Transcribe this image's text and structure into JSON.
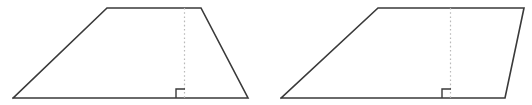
{
  "canvas": {
    "width": 532,
    "height": 105,
    "background": "#ffffff",
    "stroke_color": "#3a3a3a",
    "altitude_color": "#b9b9b9"
  },
  "figures": [
    {
      "name": "trapezoid",
      "label": "Isosceles trapezoid with altitude",
      "outline_points": "13,98 107,8 201,8 248,98 13,98",
      "altitude_line": {
        "x1": 184.5,
        "y1": 8,
        "x2": 184.5,
        "y2": 98
      },
      "right_angle_marker": "176,98 176,89 185,89",
      "vertices": [
        {
          "name": "bottom-left",
          "x": 13,
          "y": 98
        },
        {
          "name": "top-left",
          "x": 107,
          "y": 8
        },
        {
          "name": "top-right",
          "x": 201,
          "y": 8
        },
        {
          "name": "bottom-right",
          "x": 248,
          "y": 98
        }
      ]
    },
    {
      "name": "parallelogram",
      "label": "Parallelogram with altitude",
      "outline_points": "281,98 378,8 524,8 505,98 281,98",
      "altitude_line": {
        "x1": 450.5,
        "y1": 8,
        "x2": 450.5,
        "y2": 98
      },
      "right_angle_marker": "442,98 442,89 451,89",
      "vertices": [
        {
          "name": "bottom-left",
          "x": 281,
          "y": 98
        },
        {
          "name": "top-left",
          "x": 378,
          "y": 8
        },
        {
          "name": "top-right",
          "x": 524,
          "y": 8
        },
        {
          "name": "bottom-right",
          "x": 505,
          "y": 98
        }
      ]
    }
  ]
}
